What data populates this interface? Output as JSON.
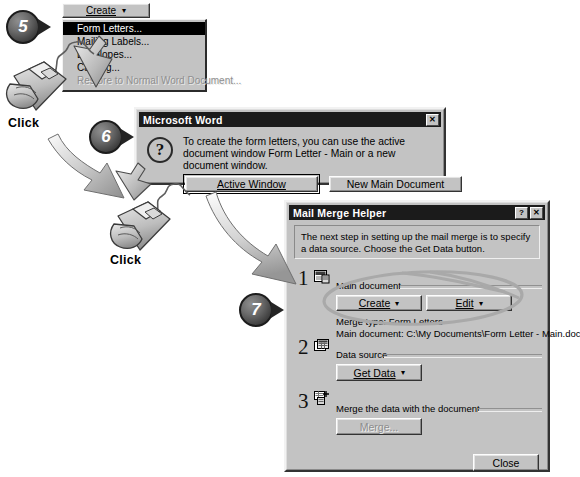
{
  "steps": [
    {
      "number": "5"
    },
    {
      "number": "6"
    },
    {
      "number": "7"
    }
  ],
  "click_labels": [
    "Click",
    "Click"
  ],
  "create_menu": {
    "button_label": "Create",
    "button_arrow": "▾",
    "items": [
      {
        "label": "Form Letters...",
        "state": "selected"
      },
      {
        "label": "Mailing Labels...",
        "state": "normal"
      },
      {
        "label": "Envelopes...",
        "state": "normal"
      },
      {
        "label": "Catalog...",
        "state": "normal"
      },
      {
        "label": "Restore to Normal Word Document...",
        "state": "disabled"
      }
    ]
  },
  "word_dialog": {
    "title": "Microsoft Word",
    "close_button": "✕",
    "icon": "question-mark-icon",
    "message": "To create the form letters, you can use the active document window Form Letter - Main or a new document window.",
    "buttons": [
      {
        "label": "Active Window",
        "default": true
      },
      {
        "label": "New Main Document",
        "default": false
      }
    ]
  },
  "mail_merge_helper": {
    "title": "Mail Merge Helper",
    "help_button": "?",
    "close_button": "✕",
    "note": "The next step in setting up the mail merge is to specify a data source. Choose the Get Data button.",
    "sections": [
      {
        "number": "1",
        "icon": "main-document-icon",
        "label": "Main document",
        "buttons": [
          {
            "label": "Create",
            "arrow": "▾",
            "disabled": false
          },
          {
            "label": "Edit",
            "arrow": "▾",
            "disabled": false
          }
        ],
        "info": [
          "Merge type: Form Letters",
          "Main document: C:\\My Documents\\Form Letter - Main.doc"
        ]
      },
      {
        "number": "2",
        "icon": "data-source-icon",
        "label": "Data source",
        "buttons": [
          {
            "label": "Get Data",
            "arrow": "▾",
            "disabled": false
          }
        ],
        "info": []
      },
      {
        "number": "3",
        "icon": "merge-icon",
        "label": "Merge the data with the document",
        "buttons": [
          {
            "label": "Merge...",
            "arrow": "",
            "disabled": true
          }
        ],
        "info": []
      }
    ],
    "close_label": "Close"
  }
}
